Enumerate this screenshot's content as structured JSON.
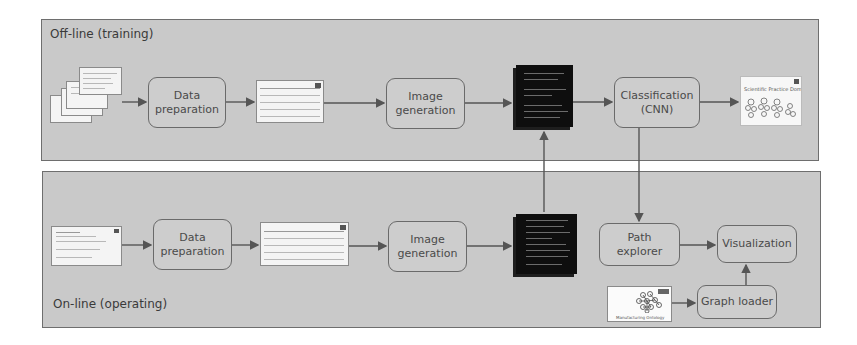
{
  "panels": {
    "offline": {
      "label": "Off-line (training)"
    },
    "online": {
      "label": "On-line (operating)"
    }
  },
  "offline_steps": {
    "data_preparation": {
      "line1": "Data",
      "line2": "preparation"
    },
    "image_generation": {
      "line1": "Image",
      "line2": "generation"
    },
    "classification": {
      "line1": "Classification",
      "line2": "(CNN)"
    }
  },
  "online_steps": {
    "data_preparation": {
      "line1": "Data",
      "line2": "preparation"
    },
    "image_generation": {
      "line1": "Image",
      "line2": "generation"
    },
    "path_explorer": {
      "line1": "Path",
      "line2": "explorer"
    },
    "visualization": {
      "label": "Visualization"
    },
    "graph_loader": {
      "label": "Graph loader"
    }
  },
  "artifacts": {
    "classification_output_title": "Scientific Practice Domain",
    "ontology_caption": "Manufacturing Ontology"
  },
  "colors": {
    "panel_bg": "#c9c9c9",
    "panel_border": "#6e6e6e",
    "box_border": "#6a6a6a",
    "arrow": "#555555",
    "image_tile": "#0e0e0e"
  }
}
